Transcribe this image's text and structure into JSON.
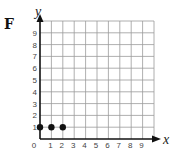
{
  "panel_label": "F",
  "chart_data": {
    "type": "scatter",
    "title": "",
    "xlabel": "x",
    "ylabel": "y",
    "xlim": [
      0,
      10
    ],
    "ylim": [
      0,
      10
    ],
    "x_ticks": [
      "0",
      "1",
      "2",
      "3",
      "4",
      "5",
      "6",
      "7",
      "8",
      "9"
    ],
    "y_ticks": [
      "1",
      "2",
      "3",
      "4",
      "5",
      "6",
      "7",
      "8",
      "9"
    ],
    "grid": true,
    "series": [
      {
        "name": "points",
        "points": [
          {
            "x": 0,
            "y": 1
          },
          {
            "x": 1,
            "y": 1
          },
          {
            "x": 2,
            "y": 1
          }
        ]
      }
    ]
  },
  "colors": {
    "grid": "#9a9a9a",
    "axis": "#111111",
    "point": "#111111"
  }
}
